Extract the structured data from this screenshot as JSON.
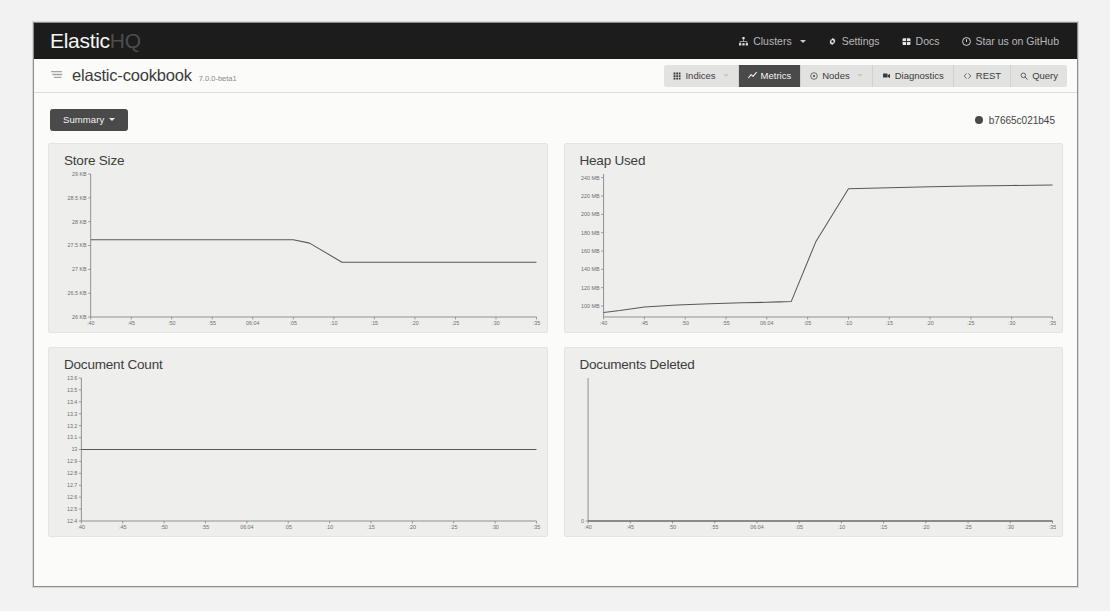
{
  "navbar": {
    "brand_primary": "Elastic",
    "brand_secondary": "HQ",
    "links": [
      {
        "label": "Clusters",
        "icon": "sitemap-icon",
        "caret": true
      },
      {
        "label": "Settings",
        "icon": "gear-icon",
        "caret": false
      },
      {
        "label": "Docs",
        "icon": "book-icon",
        "caret": false
      },
      {
        "label": "Star us on GitHub",
        "icon": "github-icon",
        "caret": false
      }
    ]
  },
  "subbar": {
    "cluster_icon": "elastic-logo-icon",
    "cluster_name": "elastic-cookbook",
    "cluster_version": "7.0.0-beta1",
    "nav": [
      {
        "label": "Indices",
        "icon": "grid-icon",
        "caret": true,
        "active": false
      },
      {
        "label": "Metrics",
        "icon": "chart-line-icon",
        "caret": false,
        "active": true
      },
      {
        "label": "Nodes",
        "icon": "circle-dot-icon",
        "caret": true,
        "active": false
      },
      {
        "label": "Diagnostics",
        "icon": "stethoscope-icon",
        "caret": false,
        "active": false
      },
      {
        "label": "REST",
        "icon": "code-icon",
        "caret": false,
        "active": false
      },
      {
        "label": "Query",
        "icon": "search-icon",
        "caret": false,
        "active": false
      }
    ]
  },
  "toolbar": {
    "summary_label": "Summary",
    "node_id": "b7665c021b45"
  },
  "chart_data": [
    {
      "id": "store-size",
      "type": "line",
      "title": "Store Size",
      "xlabel": "",
      "ylabel": "",
      "grid": false,
      "legend": "none",
      "ylim": [
        26,
        29
      ],
      "yticks": [
        29,
        28.5,
        28,
        27.5,
        27,
        26.5,
        26
      ],
      "ytick_labels": [
        "29 KB",
        "28.5 KB",
        "28 KB",
        "27.5 KB",
        "27 KB",
        "26.5 KB",
        "26 KB"
      ],
      "xtick_labels": [
        ":40",
        ":45",
        ":50",
        ":55",
        "06:04",
        ":05",
        ":10",
        ":15",
        ":20",
        ":25",
        ":30",
        ":35"
      ],
      "x": [
        0,
        1,
        2,
        3,
        4,
        5,
        5.4,
        6.2,
        7,
        8,
        9,
        10,
        11
      ],
      "values": [
        27.62,
        27.62,
        27.62,
        27.62,
        27.62,
        27.62,
        27.55,
        27.15,
        27.15,
        27.15,
        27.15,
        27.15,
        27.15
      ]
    },
    {
      "id": "heap-used",
      "type": "line",
      "title": "Heap Used",
      "xlabel": "",
      "ylabel": "",
      "grid": false,
      "legend": "none",
      "ylim": [
        88,
        244
      ],
      "yticks": [
        240,
        220,
        200,
        180,
        160,
        140,
        120,
        100
      ],
      "ytick_labels": [
        "240 MB",
        "220 MB",
        "200 MB",
        "180 MB",
        "160 MB",
        "140 MB",
        "120 MB",
        "100 MB"
      ],
      "xtick_labels": [
        ":40",
        ":45",
        ":50",
        ":55",
        "06:04",
        ":05",
        ":10",
        ":15",
        ":20",
        ":25",
        ":30",
        ":35"
      ],
      "x": [
        0,
        0.4,
        1,
        1.8,
        2.6,
        3.4,
        4,
        4.3,
        4.6,
        5.2,
        6,
        7,
        8,
        9,
        10,
        11
      ],
      "values": [
        93,
        95,
        99,
        101,
        102.5,
        103.5,
        104,
        104.5,
        105,
        170,
        228,
        229,
        230,
        231,
        231.5,
        232
      ]
    },
    {
      "id": "document-count",
      "type": "line",
      "title": "Document Count",
      "xlabel": "",
      "ylabel": "",
      "grid": false,
      "legend": "none",
      "ylim": [
        12.4,
        13.6
      ],
      "yticks": [
        13.6,
        13.5,
        13.4,
        13.3,
        13.2,
        13.1,
        13,
        12.9,
        12.8,
        12.7,
        12.6,
        12.5,
        12.4
      ],
      "ytick_labels": [
        "13.6",
        "13.5",
        "13.4",
        "13.3",
        "13.2",
        "13.1",
        "13",
        "12.9",
        "12.8",
        "12.7",
        "12.6",
        "12.5",
        "12.4"
      ],
      "xtick_labels": [
        ":40",
        ":45",
        ":50",
        ":55",
        "06:04",
        ":05",
        ":10",
        ":15",
        ":20",
        ":25",
        ":30",
        ":35"
      ],
      "x": [
        0,
        1,
        2,
        3,
        4,
        5,
        6,
        7,
        8,
        9,
        10,
        11
      ],
      "values": [
        13,
        13,
        13,
        13,
        13,
        13,
        13,
        13,
        13,
        13,
        13,
        13
      ]
    },
    {
      "id": "documents-deleted",
      "type": "line",
      "title": "Documents Deleted",
      "xlabel": "",
      "ylabel": "",
      "grid": false,
      "legend": "none",
      "ylim": [
        0,
        1
      ],
      "yticks": [
        0
      ],
      "ytick_labels": [
        "0"
      ],
      "xtick_labels": [
        ":40",
        ":45",
        ":50",
        ":55",
        "06:04",
        ":05",
        ":10",
        ":15",
        ":20",
        ":25",
        ":30",
        ":35"
      ],
      "x": [
        0,
        1,
        2,
        3,
        4,
        5,
        6,
        7,
        8,
        9,
        10,
        11
      ],
      "values": [
        0,
        0,
        0,
        0,
        0,
        0,
        0,
        0,
        0,
        0,
        0,
        0
      ]
    }
  ],
  "colors": {
    "navbar_bg": "#1c1c1c",
    "panel_bg": "#eeeeec",
    "accent_dark": "#4a4a4a",
    "line": "#595959"
  }
}
